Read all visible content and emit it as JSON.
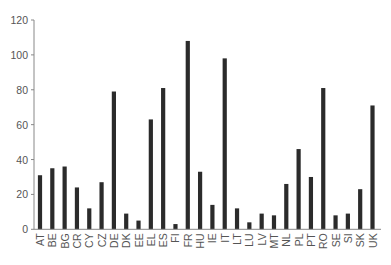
{
  "chart_data": {
    "type": "bar",
    "title": "",
    "xlabel": "",
    "ylabel": "",
    "ylim": [
      0,
      120
    ],
    "yticks": [
      0,
      20,
      40,
      60,
      80,
      100,
      120
    ],
    "grid": false,
    "legend": null,
    "bar_color": "#2b2b2b",
    "categories": [
      "AT",
      "BE",
      "BG",
      "CR",
      "CY",
      "CZ",
      "DE",
      "DK",
      "EE",
      "EL",
      "ES",
      "FI",
      "FR",
      "HU",
      "IE",
      "IT",
      "LT",
      "LU",
      "LV",
      "MT",
      "NL",
      "PL",
      "PT",
      "RO",
      "SE",
      "SI",
      "SK",
      "UK"
    ],
    "values": [
      31,
      35,
      36,
      24,
      12,
      27,
      79,
      9,
      5,
      63,
      81,
      3,
      108,
      33,
      14,
      98,
      12,
      4,
      9,
      8,
      26,
      46,
      30,
      81,
      8,
      9,
      23,
      71
    ]
  }
}
